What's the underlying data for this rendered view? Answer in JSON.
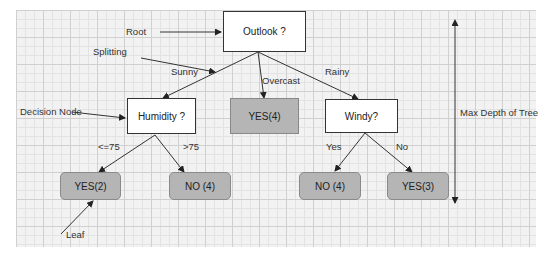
{
  "diagram": {
    "nodes": {
      "root": "Outlook ?",
      "humidity": "Humidity ?",
      "overcast_leaf": "YES(4)",
      "windy": "Windy?",
      "leaf_humidity_low": "YES(2)",
      "leaf_humidity_high": "NO (4)",
      "leaf_windy_yes": "NO (4)",
      "leaf_windy_no": "YES(3)"
    },
    "edge_labels": {
      "sunny": "Sunny",
      "overcast": "Overcast",
      "rainy": "Rainy",
      "le75": "<=75",
      "gt75": ">75",
      "yes": "Yes",
      "no": "No"
    },
    "annotations": {
      "root": "Root",
      "splitting": "Splitting",
      "decision_node": "Decision Node",
      "leaf": "Leaf",
      "max_depth": "Max Depth of Tree"
    }
  }
}
